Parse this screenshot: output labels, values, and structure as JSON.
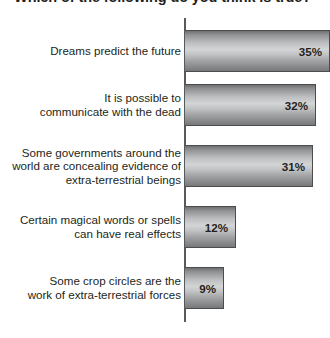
{
  "chart_data": {
    "type": "bar",
    "orientation": "horizontal",
    "title": "Which of the following do you think is true?",
    "xlabel": "",
    "ylabel": "",
    "xlim": [
      0,
      40
    ],
    "grid": false,
    "legend": null,
    "value_suffix": "%",
    "categories": [
      "Dreams predict the future",
      "It is possible to\ncommunicate with the dead",
      "Some governments around the\nworld are concealing evidence of\nextra-terrestrial beings",
      "Certain magical words or spells\ncan have real effects",
      "Some crop circles are the\nwork of extra-terrestrial forces"
    ],
    "values": [
      35,
      32,
      31,
      12,
      9
    ],
    "value_labels": [
      "35%",
      "32%",
      "31%",
      "12%",
      "9%"
    ],
    "bars": [
      {
        "label": "Dreams predict the future",
        "value": 35,
        "value_label": "35%",
        "top": 12,
        "width": 145,
        "clipped": true
      },
      {
        "label": "It is possible to\ncommunicate with the dead",
        "value": 32,
        "value_label": "32%",
        "top": 66,
        "width": 131,
        "clipped": false
      },
      {
        "label": "Some governments around the\nworld are concealing evidence of\nextra-terrestrial beings",
        "value": 31,
        "value_label": "31%",
        "top": 127,
        "width": 128,
        "clipped": false
      },
      {
        "label": "Certain magical words or spells\ncan have real effects",
        "value": 12,
        "value_label": "12%",
        "top": 188,
        "width": 51,
        "clipped": false
      },
      {
        "label": "Some crop circles are the\nwork of extra-terrestrial forces",
        "value": 9,
        "value_label": "9%",
        "top": 249,
        "width": 39,
        "clipped": false
      }
    ],
    "colors": {
      "bar_fill_light": "#d2d4d6",
      "bar_fill_dark": "#6f7072",
      "bar_border": "#4b4c4e",
      "axis": "#58595b",
      "text": "#231f20",
      "background": "#ffffff"
    }
  }
}
